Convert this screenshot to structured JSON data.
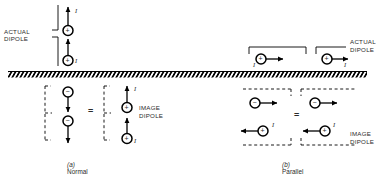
{
  "figure": {
    "ground_label": "hatched-ground-plane",
    "equals_symbol": "=",
    "current_symbol": "I",
    "plus_symbol": "+",
    "minus_symbol": "−"
  },
  "panels": [
    {
      "id": "a",
      "caption_prefix": "(a)",
      "caption": "Normal",
      "actual_label_line1": "ACTUAL",
      "actual_label_line2": "DIPOLE",
      "image_label_line1": "IMAGE",
      "image_label_line2": "DIPOLE",
      "orientation": "vertical",
      "actual_dipoles": [
        {
          "charge": "+",
          "arrow": "up",
          "current": "I"
        },
        {
          "charge": "+",
          "arrow": "up",
          "current": "I"
        }
      ],
      "image_dipoles_left": [
        {
          "charge": "−",
          "arrow": "down",
          "current": ""
        },
        {
          "charge": "−",
          "arrow": "down",
          "current": ""
        }
      ],
      "image_dipoles_right": [
        {
          "charge": "+",
          "arrow": "up",
          "current": "I"
        },
        {
          "charge": "+",
          "arrow": "up",
          "current": "I"
        }
      ]
    },
    {
      "id": "b",
      "caption_prefix": "(b)",
      "caption": "Parallel",
      "actual_label_line1": "ACTUAL",
      "actual_label_line2": "DIPOLE",
      "image_label_line1": "IMAGE",
      "image_label_line2": "DIPOLE",
      "orientation": "horizontal",
      "actual_dipoles": [
        {
          "charge": "+",
          "arrow": "right",
          "current": "I"
        },
        {
          "charge": "+",
          "arrow": "right",
          "current": "I"
        }
      ],
      "image_dipoles_top": [
        {
          "charge": "−",
          "arrow": "right",
          "current": ""
        },
        {
          "charge": "−",
          "arrow": "right",
          "current": ""
        }
      ],
      "image_dipoles_bottom": [
        {
          "charge": "+",
          "arrow": "left",
          "current": "I"
        },
        {
          "charge": "+",
          "arrow": "left",
          "current": "I"
        }
      ]
    }
  ],
  "colors": {
    "stroke": "#000000",
    "text": "#2b2b2b",
    "background": "#ffffff"
  }
}
